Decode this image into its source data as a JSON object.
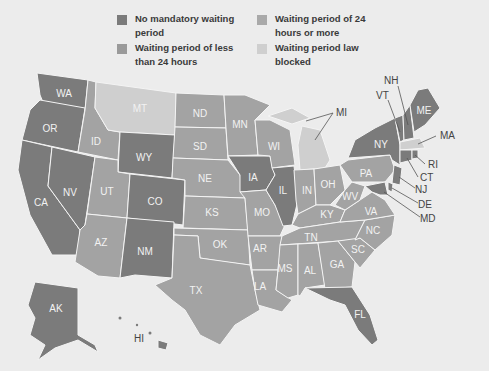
{
  "legend": {
    "items": [
      {
        "label": "No mandatory waiting period",
        "color": "#7b7b7b"
      },
      {
        "label": "Waiting period of 24 hours or more",
        "color": "#a9a9a9"
      },
      {
        "label": "Waiting period of less than 24 hours",
        "color": "#9a9a9a"
      },
      {
        "label": "Waiting period law blocked",
        "color": "#cfcfcf"
      }
    ]
  },
  "map": {
    "states": {
      "WA": {
        "label": "WA",
        "category": "No mandatory waiting period"
      },
      "OR": {
        "label": "OR",
        "category": "No mandatory waiting period"
      },
      "CA": {
        "label": "CA",
        "category": "No mandatory waiting period"
      },
      "NV": {
        "label": "NV",
        "category": "No mandatory waiting period"
      },
      "ID": {
        "label": "ID",
        "category": "Waiting period"
      },
      "MT": {
        "label": "MT",
        "category": "Waiting period law blocked"
      },
      "WY": {
        "label": "WY",
        "category": "No mandatory waiting period"
      },
      "UT": {
        "label": "UT",
        "category": "Waiting period"
      },
      "CO": {
        "label": "CO",
        "category": "No mandatory waiting period"
      },
      "AZ": {
        "label": "AZ",
        "category": "Waiting period"
      },
      "NM": {
        "label": "NM",
        "category": "No mandatory waiting period"
      },
      "ND": {
        "label": "ND",
        "category": "Waiting period"
      },
      "SD": {
        "label": "SD",
        "category": "Waiting period"
      },
      "NE": {
        "label": "NE",
        "category": "Waiting period"
      },
      "KS": {
        "label": "KS",
        "category": "Waiting period"
      },
      "OK": {
        "label": "OK",
        "category": "Waiting period"
      },
      "TX": {
        "label": "TX",
        "category": "Waiting period"
      },
      "MN": {
        "label": "MN",
        "category": "Waiting period"
      },
      "IA": {
        "label": "IA",
        "category": "No mandatory waiting period"
      },
      "MO": {
        "label": "MO",
        "category": "Waiting period"
      },
      "AR": {
        "label": "AR",
        "category": "Waiting period"
      },
      "LA": {
        "label": "LA",
        "category": "Waiting period"
      },
      "WI": {
        "label": "WI",
        "category": "Waiting period"
      },
      "IL": {
        "label": "IL",
        "category": "No mandatory waiting period"
      },
      "MI": {
        "label": "MI",
        "category": "Waiting period law blocked"
      },
      "IN": {
        "label": "IN",
        "category": "Waiting period"
      },
      "OH": {
        "label": "OH",
        "category": "Waiting period"
      },
      "KY": {
        "label": "KY",
        "category": "Waiting period"
      },
      "TN": {
        "label": "TN",
        "category": "Waiting period"
      },
      "MS": {
        "label": "MS",
        "category": "Waiting period"
      },
      "AL": {
        "label": "AL",
        "category": "Waiting period"
      },
      "GA": {
        "label": "GA",
        "category": "Waiting period"
      },
      "FL": {
        "label": "FL",
        "category": "No mandatory waiting period"
      },
      "SC": {
        "label": "SC",
        "category": "Waiting period"
      },
      "NC": {
        "label": "NC",
        "category": "Waiting period"
      },
      "VA": {
        "label": "VA",
        "category": "Waiting period"
      },
      "WV": {
        "label": "WV",
        "category": "Waiting period"
      },
      "PA": {
        "label": "PA",
        "category": "Waiting period"
      },
      "NY": {
        "label": "NY",
        "category": "No mandatory waiting period"
      },
      "VT": {
        "label": "VT",
        "category": "No mandatory waiting period"
      },
      "NH": {
        "label": "NH",
        "category": "No mandatory waiting period"
      },
      "ME": {
        "label": "ME",
        "category": "No mandatory waiting period"
      },
      "MA": {
        "label": "MA",
        "category": "Waiting period law blocked"
      },
      "RI": {
        "label": "RI",
        "category": "No mandatory waiting period"
      },
      "CT": {
        "label": "CT",
        "category": "No mandatory waiting period"
      },
      "NJ": {
        "label": "NJ",
        "category": "No mandatory waiting period"
      },
      "DE": {
        "label": "DE",
        "category": "No mandatory waiting period"
      },
      "MD": {
        "label": "MD",
        "category": "No mandatory waiting period"
      },
      "AK": {
        "label": "AK",
        "category": "No mandatory waiting period"
      },
      "HI": {
        "label": "HI",
        "category": "No mandatory waiting period"
      }
    }
  }
}
